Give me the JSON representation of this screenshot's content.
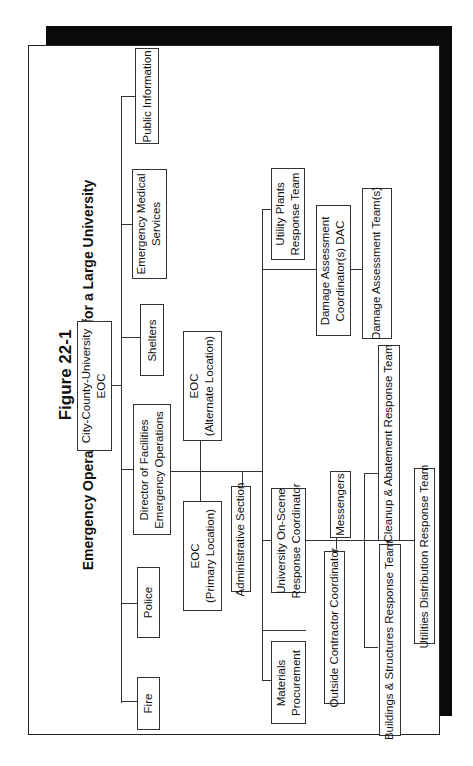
{
  "figure": {
    "number": "Figure 22-1",
    "title": "Emergency Operations Organization for a Large University",
    "orientation": "rotated 90 degrees counter-clockwise"
  },
  "boxes": {
    "city_eoc": [
      "City-County-University",
      "EOC"
    ],
    "public_information": [
      "Public Information"
    ],
    "ems": [
      "Emergency Medical",
      "Services"
    ],
    "shelters": [
      "Shelters"
    ],
    "director": [
      "Director of Facilities",
      "Emergency Operations"
    ],
    "police": [
      "Police"
    ],
    "fire": [
      "Fire"
    ],
    "eoc_alternate": [
      "EOC",
      "(Alternate Location)"
    ],
    "eoc_primary": [
      "EOC",
      "(Primary Location)"
    ],
    "admin_section": [
      "Administrative Section"
    ],
    "on_scene": [
      "University On-Scene",
      "Response Coordinator"
    ],
    "materials": [
      "Materials",
      "Procurement"
    ],
    "utility_plants": [
      "Utility Plants",
      "Response Team"
    ],
    "dac": [
      "Damage Assessment",
      "Coordinator(s) DAC"
    ],
    "da_teams": [
      "Damage Assessment Team(s)"
    ],
    "messengers": [
      "Messengers"
    ],
    "outside_contractor": [
      "Outside Contractor Coordinator"
    ],
    "cleanup": [
      "Cleanup & Abatement Response Team"
    ],
    "buildings": [
      "Buildings & Structures Response Team"
    ],
    "utilities_dist": [
      "Utilities Distribution Response Team"
    ]
  },
  "hierarchy": {
    "City-County-University EOC": [
      "Public Information",
      "Emergency Medical Services",
      "Shelters",
      "Director of Facilities Emergency Operations",
      "Police",
      "Fire"
    ],
    "Director of Facilities Emergency Operations": [
      "EOC (Alternate Location)",
      "EOC (Primary Location)",
      "Administrative Section",
      "Utility Plants Response Team",
      "Damage Assessment Coordinator(s) DAC",
      "University On-Scene Response Coordinator",
      "Materials Procurement"
    ],
    "Damage Assessment Coordinator(s) DAC": [
      "Damage Assessment Team(s)"
    ],
    "University On-Scene Response Coordinator": [
      "Messengers",
      "Outside Contractor Coordinator",
      "Cleanup & Abatement Response Team",
      "Buildings & Structures Response Team",
      "Utilities Distribution Response Team"
    ]
  }
}
